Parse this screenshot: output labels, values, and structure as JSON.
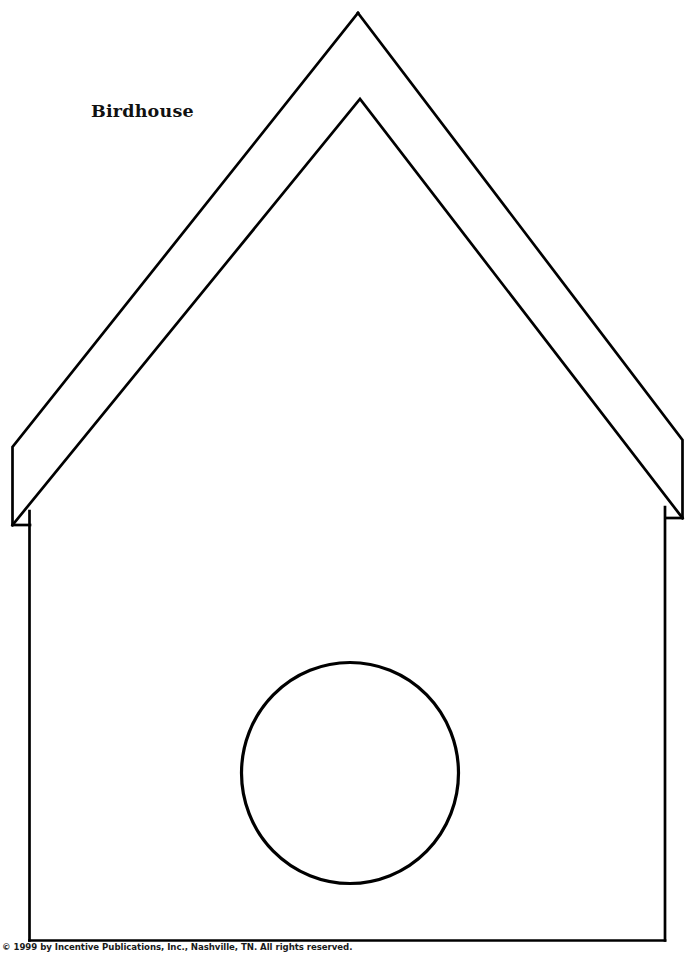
{
  "page": {
    "title": "Birdhouse",
    "width": 688,
    "height": 954,
    "background_color": "#ffffff",
    "ink_color": "#000000"
  },
  "label": {
    "text": "Birdhouse",
    "x": 91,
    "y": 103
  },
  "footer": {
    "copyright_symbol": "©",
    "text": " 1999 by Incentive Publications, Inc., Nashville, TN. All rights reserved.",
    "full_text": "© 1999 by Incentive Publications, Inc., Nashville, TN. All rights reserved.",
    "year": "1999",
    "publisher": "Incentive Publications, Inc.",
    "city": "Nashville, TN",
    "rights": "All rights reserved."
  },
  "drawing": {
    "type": "line-art-template",
    "subject": "birdhouse cut-out pattern",
    "stroke_color": "#000000",
    "stroke_width": 2.6,
    "fill": "none",
    "shapes": {
      "roof_outer": {
        "name": "roof-outline",
        "points": "358,13 682,440 682,517 665,517 358,45 29,524 13,524 13,448"
      },
      "roof_outer_path": "M358,13 L683,441 L683,518 L667,518 M358,13 L12,448 L12,525 L29,525",
      "roof_left_outer": {
        "from": [
          358,
          13
        ],
        "to": [
          12,
          448
        ]
      },
      "roof_right_outer": {
        "from": [
          358,
          13
        ],
        "to": [
          683,
          441
        ]
      },
      "eave_left_vertical": {
        "from": [
          12,
          448
        ],
        "to": [
          12,
          525
        ]
      },
      "eave_right_vertical": {
        "from": [
          683,
          441
        ],
        "to": [
          683,
          518
        ]
      },
      "roof_inner_peak": [
        360,
        99
      ],
      "roof_left_inner": {
        "from": [
          360,
          99
        ],
        "to": [
          12,
          525
        ]
      },
      "roof_right_inner": {
        "from": [
          360,
          99
        ],
        "to": [
          683,
          518
        ]
      },
      "wall_left": {
        "from": [
          29,
          512
        ],
        "to": [
          29,
          940
        ]
      },
      "wall_right": {
        "from": [
          665,
          508
        ],
        "to": [
          665,
          940
        ]
      },
      "wall_base": {
        "from": [
          29,
          940
        ],
        "to": [
          665,
          940
        ]
      },
      "entrance_hole": {
        "name": "entrance-hole",
        "center_x": 350,
        "center_y": 773,
        "radius": 109
      }
    }
  }
}
